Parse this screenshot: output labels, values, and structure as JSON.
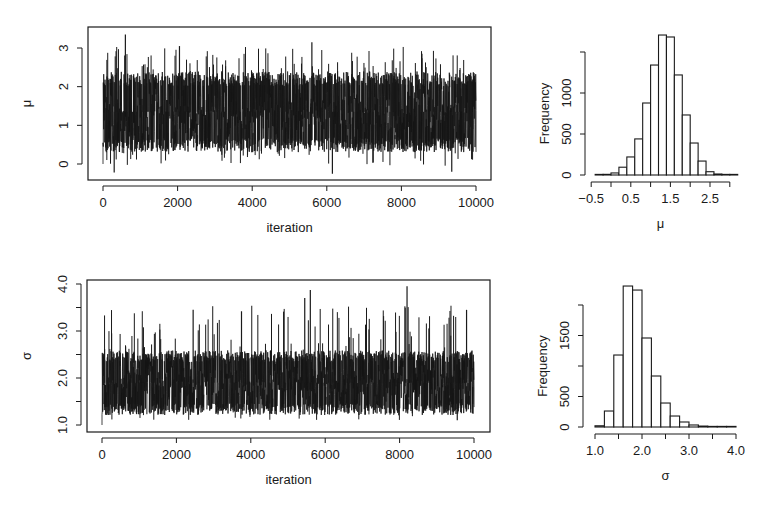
{
  "figure": {
    "background": "#ffffff",
    "ink": "#1a1a1a",
    "trace_ink": "#151515"
  },
  "chart_data": [
    {
      "id": "mu_trace",
      "type": "line",
      "title": "",
      "xlabel": "iteration",
      "ylabel": "μ",
      "xlim": [
        0,
        10000
      ],
      "ylim": [
        -0.3,
        3.4
      ],
      "xticks": [
        0,
        2000,
        4000,
        6000,
        8000,
        10000
      ],
      "xtick_labels": [
        "0",
        "2000",
        "4000",
        "6000",
        "8000",
        "10000"
      ],
      "yticks": [
        0,
        1,
        2,
        3
      ],
      "ytick_labels": [
        "0",
        "1",
        "2",
        "3"
      ],
      "grid": false,
      "series": [
        {
          "name": "μ",
          "n": 10000,
          "start_value": 0.0,
          "center": 1.35,
          "band_low": 0.4,
          "band_high": 2.3,
          "min": -0.25,
          "max": 3.35,
          "notable_spikes": [
            {
              "x": 600,
              "y": 3.35
            },
            {
              "x": 2050,
              "y": 3.05
            },
            {
              "x": 5600,
              "y": 3.15
            },
            {
              "x": 8550,
              "y": 2.85
            },
            {
              "x": 300,
              "y": -0.22
            },
            {
              "x": 6150,
              "y": -0.25
            },
            {
              "x": 9350,
              "y": -0.2
            }
          ]
        }
      ]
    },
    {
      "id": "mu_hist",
      "type": "bar",
      "title": "",
      "xlabel": "μ",
      "ylabel": "Frequency",
      "xlim": [
        -0.5,
        3.0
      ],
      "ylim": [
        0,
        1500
      ],
      "xticks": [
        -0.5,
        0.0,
        0.5,
        1.0,
        1.5,
        2.0,
        2.5,
        3.0
      ],
      "xtick_labels": [
        "-0.5",
        "",
        "0.5",
        "",
        "1.5",
        "",
        "2.5",
        ""
      ],
      "yticks": [
        0,
        500,
        1000,
        1500
      ],
      "ytick_labels": [
        "0",
        "500",
        "1000",
        ""
      ],
      "bin_width": 0.2,
      "bin_edges": [
        -0.4,
        -0.2,
        0.0,
        0.2,
        0.4,
        0.6,
        0.8,
        1.0,
        1.2,
        1.4,
        1.6,
        1.8,
        2.0,
        2.2,
        2.4,
        2.6,
        2.8,
        3.0,
        3.2
      ],
      "values": [
        3,
        8,
        25,
        95,
        220,
        440,
        878,
        1341,
        1707,
        1683,
        1220,
        732,
        390,
        170,
        40,
        12,
        4,
        2
      ],
      "grid": false
    },
    {
      "id": "sigma_trace",
      "type": "line",
      "title": "",
      "xlabel": "iteration",
      "ylabel": "σ",
      "xlim": [
        0,
        10000
      ],
      "ylim": [
        0.9,
        4.05
      ],
      "xticks": [
        0,
        2000,
        4000,
        6000,
        8000,
        10000
      ],
      "xtick_labels": [
        "0",
        "2000",
        "4000",
        "6000",
        "8000",
        "10000"
      ],
      "yticks": [
        1.0,
        1.5,
        2.0,
        2.5,
        3.0,
        3.5,
        4.0
      ],
      "ytick_labels": [
        "1.0",
        "",
        "2.0",
        "",
        "3.0",
        "",
        "4.0"
      ],
      "grid": false,
      "series": [
        {
          "name": "σ",
          "n": 10000,
          "start_value": 1.0,
          "center": 1.9,
          "band_low": 1.35,
          "band_high": 2.6,
          "min": 1.0,
          "max": 3.95,
          "notable_spikes": [
            {
              "x": 5450,
              "y": 3.7
            },
            {
              "x": 5600,
              "y": 3.87
            },
            {
              "x": 8200,
              "y": 3.95
            },
            {
              "x": 3750,
              "y": 3.42
            },
            {
              "x": 2450,
              "y": 3.45
            },
            {
              "x": 9800,
              "y": 3.45
            },
            {
              "x": 9550,
              "y": 1.1
            }
          ]
        }
      ]
    },
    {
      "id": "sigma_hist",
      "type": "bar",
      "title": "",
      "xlabel": "σ",
      "ylabel": "Frequency",
      "xlim": [
        1.0,
        4.0
      ],
      "ylim": [
        0,
        2000
      ],
      "xticks": [
        1.0,
        1.5,
        2.0,
        2.5,
        3.0,
        3.5,
        4.0
      ],
      "xtick_labels": [
        "1.0",
        "",
        "2.0",
        "",
        "3.0",
        "",
        "4.0"
      ],
      "yticks": [
        0,
        500,
        1000,
        1500,
        2000
      ],
      "ytick_labels": [
        "0",
        "500",
        "",
        "1500",
        ""
      ],
      "bin_width": 0.2,
      "bin_edges": [
        1.0,
        1.2,
        1.4,
        1.6,
        1.8,
        2.0,
        2.2,
        2.4,
        2.6,
        2.8,
        3.0,
        3.2,
        3.4,
        3.6,
        3.8,
        4.0
      ],
      "values": [
        20,
        262,
        1180,
        2311,
        2245,
        1459,
        836,
        393,
        180,
        82,
        33,
        15,
        8,
        5,
        3
      ],
      "grid": false
    }
  ]
}
